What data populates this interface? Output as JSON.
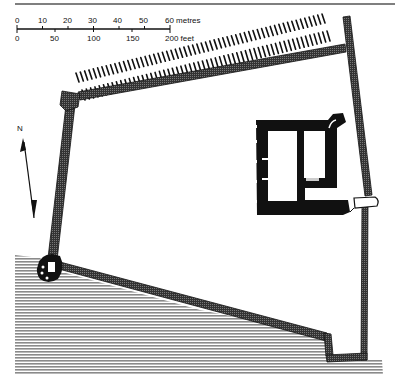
{
  "scale_bar": {
    "metres_ticks": [
      "0",
      "10",
      "20",
      "30",
      "40",
      "50",
      "60 metres"
    ],
    "feet_ticks": [
      "0",
      "50",
      "100",
      "150",
      "200 feet"
    ]
  },
  "north_arrow": {
    "label": "N"
  },
  "features": {
    "enclosure_wall": "curtain wall",
    "ditch": "hachured ditch along north side",
    "tower_house": "rectangular keep",
    "corner_towers": [
      "north-west tower",
      "south-west round tower"
    ],
    "gate": "east gate",
    "slope": "hatched slope / water to the south"
  },
  "colors": {
    "ink": "#111111",
    "wall_fill": "#555555",
    "hatch": "#9a9a9a"
  }
}
